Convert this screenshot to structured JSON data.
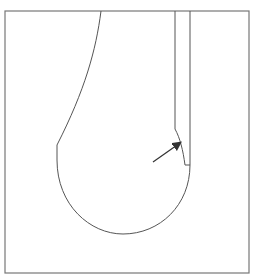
{
  "diagram": {
    "background": "#ffffff",
    "stroke_color": "#555555",
    "arrow_color": "#333333",
    "frame": {
      "x": 5,
      "y": 11,
      "width": 244,
      "height": 262
    },
    "shape_path": "M101,11 C96,50 85,90 57,145 L57,160 C57,205 90,234 123,234 C160,234 190,205 190,165 L190,11",
    "inner_path": "M175,11 L175,129 C180,138 183,150 185,165 L190,165",
    "arrow": {
      "x1": 153,
      "y1": 162,
      "x2": 180,
      "y2": 143
    }
  }
}
